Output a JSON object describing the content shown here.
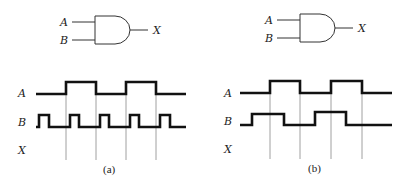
{
  "panels": [
    {
      "id": "a",
      "caption": "(a)",
      "gate": {
        "type": "AND",
        "inputs": [
          "A",
          "B"
        ],
        "output": "X"
      },
      "signals": [
        {
          "name": "A",
          "description": "two high pulses aligned with grid intervals 1 and 3"
        },
        {
          "name": "B",
          "description": "five short high pulses, one per interval"
        },
        {
          "name": "X",
          "description": "output to be determined (blank)"
        }
      ]
    },
    {
      "id": "b",
      "caption": "(b)",
      "gate": {
        "type": "AND",
        "inputs": [
          "A",
          "B"
        ],
        "output": "X"
      },
      "signals": [
        {
          "name": "A",
          "description": "two high pulses aligned with grid intervals 1 and 3"
        },
        {
          "name": "B",
          "description": "two wider high pulses offset from A"
        },
        {
          "name": "X",
          "description": "output to be determined (blank)"
        }
      ]
    }
  ],
  "labels": {
    "a_gate_A": "A",
    "a_gate_B": "B",
    "a_gate_X": "X",
    "a_wave_A": "A",
    "a_wave_B": "B",
    "a_wave_X": "X",
    "a_caption": "(a)",
    "b_gate_A": "A",
    "b_gate_B": "B",
    "b_gate_X": "X",
    "b_wave_A": "A",
    "b_wave_B": "B",
    "b_wave_X": "X",
    "b_caption": "(b)"
  }
}
